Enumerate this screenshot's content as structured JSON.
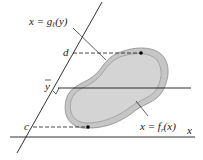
{
  "diagram": {
    "labels": {
      "left_curve": "x = g",
      "left_curve_sub": "ℓ",
      "left_curve_arg": "(y)",
      "right_curve": "x = f",
      "right_curve_sub": "r",
      "right_curve_arg": "(x)",
      "top_bound": "d",
      "bottom_bound": "c",
      "centroid": "y",
      "axis": "x"
    },
    "colors": {
      "region_fill": "#c8c8c8",
      "region_inner": "#d2d2d2",
      "region_stroke": "#8a8a8a",
      "line": "#1a1a1a"
    }
  }
}
